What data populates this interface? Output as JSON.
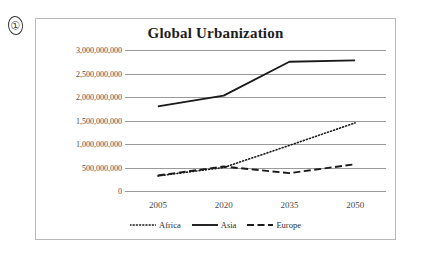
{
  "marker": {
    "label": "①"
  },
  "chart_data": {
    "type": "line",
    "title": "Global Urbanization",
    "xlabel": "",
    "ylabel": "",
    "categories": [
      "2005",
      "2020",
      "2035",
      "2050"
    ],
    "x": [
      2005,
      2020,
      2035,
      2050
    ],
    "ylim": [
      0,
      3000000000
    ],
    "ytick_values": [
      0,
      500000000,
      1000000000,
      1500000000,
      2000000000,
      2500000000,
      3000000000
    ],
    "ytick_labels": [
      "0",
      "500,000,000",
      "1,000,000,000",
      "1,500,000,000",
      "2,000,000,000",
      "2,500,000,000",
      "3,000,000,000"
    ],
    "grid": true,
    "legend_position": "bottom",
    "series": [
      {
        "name": "Africa",
        "style": "dotted",
        "color": "#1a1a1a",
        "values": [
          320000000,
          500000000,
          970000000,
          1450000000
        ]
      },
      {
        "name": "Asia",
        "style": "solid",
        "color": "#1a1a1a",
        "values": [
          1800000000,
          2030000000,
          2750000000,
          2780000000
        ]
      },
      {
        "name": "Europe",
        "style": "dashed",
        "color": "#1a1a1a",
        "values": [
          330000000,
          520000000,
          380000000,
          570000000
        ]
      }
    ]
  },
  "colors": {
    "grid": "#9a9a9a",
    "frame": "#b9b9b9",
    "text": "#4a4a4a",
    "title": "#1d1d1d",
    "series": "#1a1a1a",
    "background": "#ffffff"
  }
}
